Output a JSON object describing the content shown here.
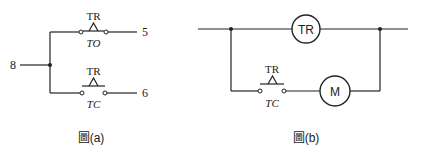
{
  "figure_a": {
    "caption": "圖(a)",
    "terminals": {
      "common": "8",
      "to_output": "5",
      "tc_output": "6"
    },
    "upper_contact": {
      "relay_label": "TR",
      "type_label": "TO"
    },
    "lower_contact": {
      "relay_label": "TR",
      "type_label": "TC"
    }
  },
  "figure_b": {
    "caption": "圖(b)",
    "coil_label": "TR",
    "motor_label": "M",
    "contact": {
      "relay_label": "TR",
      "type_label": "TC"
    }
  }
}
